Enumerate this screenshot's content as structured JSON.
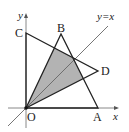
{
  "diagram": {
    "type": "coordinate-geometry",
    "axes": {
      "x_label": "x",
      "y_label": "y",
      "origin_label": "O"
    },
    "line": {
      "label": "y=x"
    },
    "points": {
      "O": "O",
      "A": "A",
      "B": "B",
      "C": "C",
      "D": "D"
    },
    "triangles": [
      "OAB",
      "OCD"
    ],
    "shaded_region": "intersection of triangle OAB and triangle OCD",
    "colors": {
      "stroke": "#222222",
      "shade": "#b3b3b3",
      "axis": "#888888"
    }
  }
}
